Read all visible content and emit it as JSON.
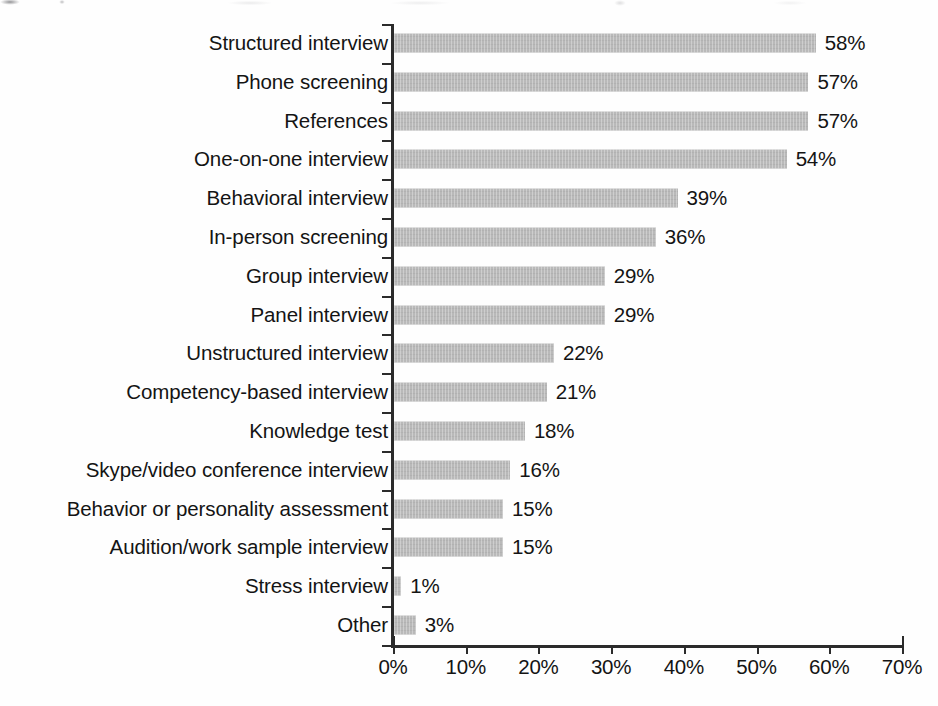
{
  "chart_data": {
    "type": "bar",
    "orientation": "horizontal",
    "title": "",
    "subtitle": "",
    "xlabel": "",
    "ylabel": "",
    "xlim": [
      0,
      70
    ],
    "grid": false,
    "legend": null,
    "bar_color": "#b9b9b9",
    "text_color": "#141414",
    "axis_color": "#2b2b2b",
    "value_suffix": "%",
    "x_ticks": [
      0,
      10,
      20,
      30,
      40,
      50,
      60,
      70
    ],
    "x_tick_labels": [
      "0%",
      "10%",
      "20%",
      "30%",
      "40%",
      "50%",
      "60%",
      "70%"
    ],
    "categories": [
      "Structured interview",
      "Phone screening",
      "References",
      "One-on-one interview",
      "Behavioral interview",
      "In-person screening",
      "Group interview",
      "Panel interview",
      "Unstructured interview",
      "Competency-based interview",
      "Knowledge test",
      "Skype/video conference interview",
      "Behavior or personality assessment",
      "Audition/work sample interview",
      "Stress interview",
      "Other"
    ],
    "values": [
      58,
      57,
      57,
      54,
      39,
      36,
      29,
      29,
      22,
      21,
      18,
      16,
      15,
      15,
      1,
      3
    ],
    "value_labels": [
      "58%",
      "57%",
      "57%",
      "54%",
      "39%",
      "36%",
      "29%",
      "29%",
      "22%",
      "21%",
      "18%",
      "16%",
      "15%",
      "15%",
      "1%",
      "3%"
    ]
  }
}
